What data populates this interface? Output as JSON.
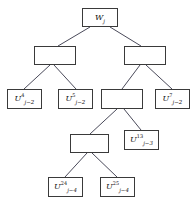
{
  "diagram": {
    "type": "tree",
    "title": "",
    "background_color": "#ffffff",
    "box_border_color": "#3a3a3a",
    "edge_color": "#4a4a5a",
    "nodes": [
      {
        "id": "root",
        "name": "node-w-j",
        "label_base": "W",
        "label_sup": "",
        "label_sub": "j",
        "has_label": true,
        "x": 82,
        "y": 8,
        "w": 36,
        "h": 19,
        "level": 1
      },
      {
        "id": "n-l1",
        "name": "node-internal-left",
        "label_base": "",
        "label_sup": "",
        "label_sub": "",
        "has_label": false,
        "x": 34,
        "y": 46,
        "w": 42,
        "h": 19,
        "level": 2
      },
      {
        "id": "n-r1",
        "name": "node-internal-right",
        "label_base": "",
        "label_sup": "",
        "label_sub": "",
        "has_label": false,
        "x": 124,
        "y": 46,
        "w": 42,
        "h": 19,
        "level": 2
      },
      {
        "id": "u4",
        "name": "node-u4-j-minus-2",
        "label_base": "U",
        "label_sup": "4",
        "label_sub": "j−2",
        "has_label": true,
        "x": 7,
        "y": 89,
        "w": 35,
        "h": 20,
        "level": 3
      },
      {
        "id": "u5",
        "name": "node-u5-j-minus-2",
        "label_base": "U",
        "label_sup": "5",
        "label_sub": "j−2",
        "has_label": true,
        "x": 58,
        "y": 89,
        "w": 35,
        "h": 20,
        "level": 3
      },
      {
        "id": "n-m2",
        "name": "node-internal-middle",
        "label_base": "",
        "label_sup": "",
        "label_sub": "",
        "has_label": false,
        "x": 101,
        "y": 89,
        "w": 42,
        "h": 20,
        "level": 3
      },
      {
        "id": "u7",
        "name": "node-u7-j-minus-2",
        "label_base": "U",
        "label_sup": "7",
        "label_sub": "j−2",
        "has_label": true,
        "x": 155,
        "y": 89,
        "w": 35,
        "h": 20,
        "level": 3
      },
      {
        "id": "n-m3",
        "name": "node-internal-lower",
        "label_base": "",
        "label_sup": "",
        "label_sub": "",
        "has_label": false,
        "x": 70,
        "y": 134,
        "w": 39,
        "h": 19,
        "level": 4
      },
      {
        "id": "u13",
        "name": "node-u13-j-minus-3",
        "label_base": "U",
        "label_sup": "13",
        "label_sub": "j−3",
        "has_label": true,
        "x": 124,
        "y": 130,
        "w": 35,
        "h": 20,
        "level": 4
      },
      {
        "id": "u24",
        "name": "node-u24-j-minus-4",
        "label_base": "U",
        "label_sup": "24",
        "label_sub": "j−4",
        "has_label": true,
        "x": 48,
        "y": 177,
        "w": 35,
        "h": 20,
        "level": 5
      },
      {
        "id": "u25",
        "name": "node-u25-j-minus-4",
        "label_base": "U",
        "label_sup": "25",
        "label_sub": "j−4",
        "has_label": true,
        "x": 100,
        "y": 177,
        "w": 35,
        "h": 20,
        "level": 5
      }
    ],
    "edges": [
      {
        "name": "edge-root-to-internal-left",
        "from": "root",
        "to": "n-l1",
        "x1": 90,
        "y1": 27,
        "x2": 58,
        "y2": 46
      },
      {
        "name": "edge-root-to-internal-right",
        "from": "root",
        "to": "n-r1",
        "x1": 110,
        "y1": 27,
        "x2": 141,
        "y2": 46
      },
      {
        "name": "edge-internal-left-to-u4",
        "from": "n-l1",
        "to": "u4",
        "x1": 50,
        "y1": 65,
        "x2": 24,
        "y2": 89
      },
      {
        "name": "edge-internal-left-to-u5",
        "from": "n-l1",
        "to": "u5",
        "x1": 54,
        "y1": 65,
        "x2": 76,
        "y2": 89
      },
      {
        "name": "edge-internal-right-to-middle",
        "from": "n-r1",
        "to": "n-m2",
        "x1": 140,
        "y1": 65,
        "x2": 122,
        "y2": 89
      },
      {
        "name": "edge-internal-right-to-u7",
        "from": "n-r1",
        "to": "u7",
        "x1": 146,
        "y1": 65,
        "x2": 172,
        "y2": 89
      },
      {
        "name": "edge-middle-to-lower",
        "from": "n-m2",
        "to": "n-m3",
        "x1": 117,
        "y1": 109,
        "x2": 90,
        "y2": 134
      },
      {
        "name": "edge-middle-to-u13",
        "from": "n-m2",
        "to": "u13",
        "x1": 124,
        "y1": 109,
        "x2": 141,
        "y2": 130
      },
      {
        "name": "edge-lower-to-u24",
        "from": "n-m3",
        "to": "u24",
        "x1": 87,
        "y1": 153,
        "x2": 65,
        "y2": 177
      },
      {
        "name": "edge-lower-to-u25",
        "from": "n-m3",
        "to": "u25",
        "x1": 92,
        "y1": 153,
        "x2": 117,
        "y2": 177
      }
    ]
  }
}
